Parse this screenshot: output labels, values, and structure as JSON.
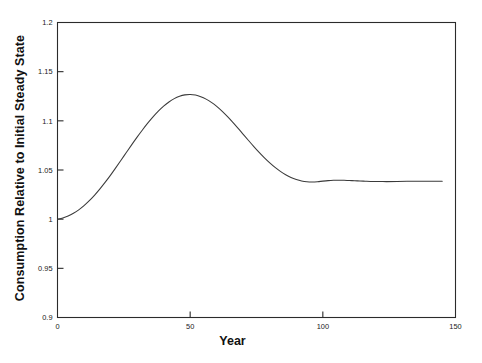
{
  "chart_data": {
    "type": "line",
    "title": "",
    "xlabel": "Year",
    "ylabel": "Consumption Relative to Initial Steady State",
    "xlim": [
      0,
      150
    ],
    "ylim": [
      0.9,
      1.2
    ],
    "xticks": [
      0,
      50,
      100,
      150
    ],
    "xtick_labels": [
      "0",
      "50",
      "100",
      "150"
    ],
    "yticks": [
      0.9,
      0.95,
      1,
      1.05,
      1.1,
      1.15,
      1.2
    ],
    "ytick_labels": [
      "0.9",
      "0.95",
      "1",
      "1.05",
      "1.1",
      "1.15",
      "1.2"
    ],
    "grid": false,
    "legend": null,
    "line_color": "#3a3a3a",
    "frame_color": "#2b2b2b",
    "background": "#ffffff",
    "annotations": [],
    "series": [
      {
        "name": "Consumption",
        "x": [
          0,
          2,
          4,
          6,
          8,
          10,
          12,
          14,
          16,
          18,
          20,
          22,
          24,
          26,
          28,
          30,
          32,
          34,
          36,
          38,
          40,
          42,
          44,
          46,
          48,
          50,
          52,
          54,
          56,
          58,
          60,
          62,
          64,
          66,
          68,
          70,
          72,
          74,
          76,
          78,
          80,
          82,
          84,
          86,
          88,
          90,
          92,
          94,
          96,
          98,
          100,
          102,
          104,
          106,
          108,
          110,
          112,
          114,
          116,
          118,
          120,
          124,
          128,
          132,
          136,
          140,
          145
        ],
        "y": [
          1.0,
          1.0012,
          1.0032,
          1.006,
          1.0095,
          1.0138,
          1.0188,
          1.0245,
          1.0308,
          1.0376,
          1.0448,
          1.0524,
          1.0602,
          1.068,
          1.0758,
          1.0834,
          1.0907,
          1.0976,
          1.104,
          1.1098,
          1.1149,
          1.1192,
          1.1226,
          1.125,
          1.1264,
          1.1268,
          1.1262,
          1.1246,
          1.1221,
          1.1188,
          1.1147,
          1.1099,
          1.1045,
          1.0987,
          1.0926,
          1.0863,
          1.08,
          1.0738,
          1.0679,
          1.0623,
          1.0572,
          1.0526,
          1.0486,
          1.0452,
          1.0424,
          1.0403,
          1.0388,
          1.038,
          1.0378,
          1.0381,
          1.0387,
          1.0392,
          1.0395,
          1.0396,
          1.0395,
          1.0393,
          1.0391,
          1.0388,
          1.0386,
          1.0384,
          1.0383,
          1.0382,
          1.0383,
          1.0385,
          1.0386,
          1.0386,
          1.0386
        ]
      }
    ],
    "key_points": {
      "initial_value": 1.0,
      "peak_value": 1.1268,
      "peak_year": 50,
      "local_min_value": 1.0378,
      "local_min_year": 96,
      "local_max_value": 1.0396,
      "local_max_year": 106,
      "final_value": 1.0386,
      "final_year": 145
    }
  }
}
